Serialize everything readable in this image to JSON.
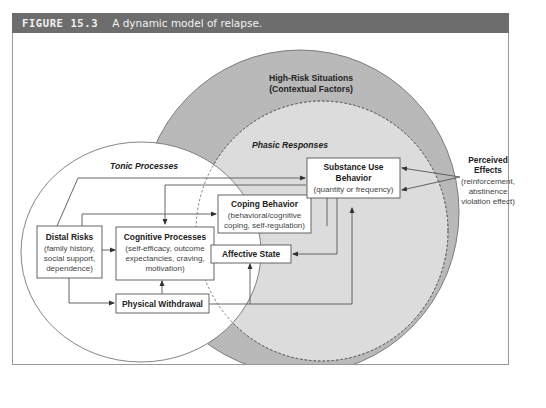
{
  "figure": {
    "number": "FIGURE 15.3",
    "caption": "A dynamic model of relapse."
  },
  "regions": {
    "high_risk": {
      "title": "High-Risk Situations",
      "subtitle": "(Contextual Factors)"
    },
    "tonic": {
      "title": "Tonic Processes"
    },
    "phasic": {
      "title": "Phasic Responses"
    }
  },
  "boxes": {
    "distal_risks": {
      "title": "Distal Risks",
      "lines": [
        "(family history,",
        "social support,",
        "dependence)"
      ]
    },
    "cognitive": {
      "title": "Cognitive Processes",
      "lines": [
        "(self-efficacy, outcome",
        "expectancies, craving,",
        "motivation)"
      ]
    },
    "withdrawal": {
      "title": "Physical Withdrawal"
    },
    "coping": {
      "title": "Coping Behavior",
      "lines": [
        "(behavioral/cognitive",
        "coping, self-regulation)"
      ]
    },
    "affective": {
      "title": "Affective State"
    },
    "substance": {
      "title_1": "Substance Use",
      "title_2": "Behavior",
      "lines": [
        "(quantity or frequency)"
      ]
    }
  },
  "perceived_effects": {
    "title_1": "Perceived",
    "title_2": "Effects",
    "lines": [
      "(reinforcement,",
      "abstinence",
      "violation effect)"
    ]
  },
  "colors": {
    "title_bar": "#6d6d6d",
    "high_risk_fill": "#b9b9b9",
    "phasic_fill": "#dcdcdc",
    "tonic_fill": "#ffffff",
    "line": "#555555"
  }
}
